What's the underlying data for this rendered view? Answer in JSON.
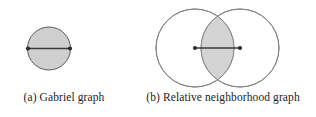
{
  "figure": {
    "background_color": "#ffffff",
    "panels": [
      {
        "key": "gabriel",
        "caption": "(a) Gabriel graph",
        "diagram": {
          "type": "gabriel-disk",
          "description": "Single shaded disk whose diameter is the edge between two points",
          "fill_color": "#cfcfcf",
          "stroke_color": "#5a5a5a",
          "edge_color": "#3a3a3a",
          "node_color": "#2b2b2b",
          "circle": {
            "cx": 49,
            "cy": 48.5,
            "r": 21.5
          },
          "nodes": [
            {
              "x": 28,
              "y": 48.5
            },
            {
              "x": 70,
              "y": 48.5
            }
          ],
          "edge": {
            "x1": 28,
            "y1": 48.5,
            "x2": 70,
            "y2": 48.5
          }
        }
      },
      {
        "key": "rng",
        "caption": "(b) Relative neighborhood graph",
        "diagram": {
          "type": "rng-lune",
          "description": "Two overlapping circles of equal radius centred on the two points; their lens-shaped intersection is shaded",
          "fill_color": "#d4d4d4",
          "stroke_color": "#7a7a7a",
          "edge_color": "#3a3a3a",
          "node_color": "#2b2b2b",
          "circles": [
            {
              "cx": 65,
              "cy": 48,
              "r": 39
            },
            {
              "cx": 110,
              "cy": 48,
              "r": 39
            }
          ],
          "nodes": [
            {
              "x": 65,
              "y": 48
            },
            {
              "x": 110,
              "y": 48
            }
          ],
          "edge": {
            "x1": 65,
            "y1": 48,
            "x2": 110,
            "y2": 48
          }
        }
      }
    ]
  }
}
